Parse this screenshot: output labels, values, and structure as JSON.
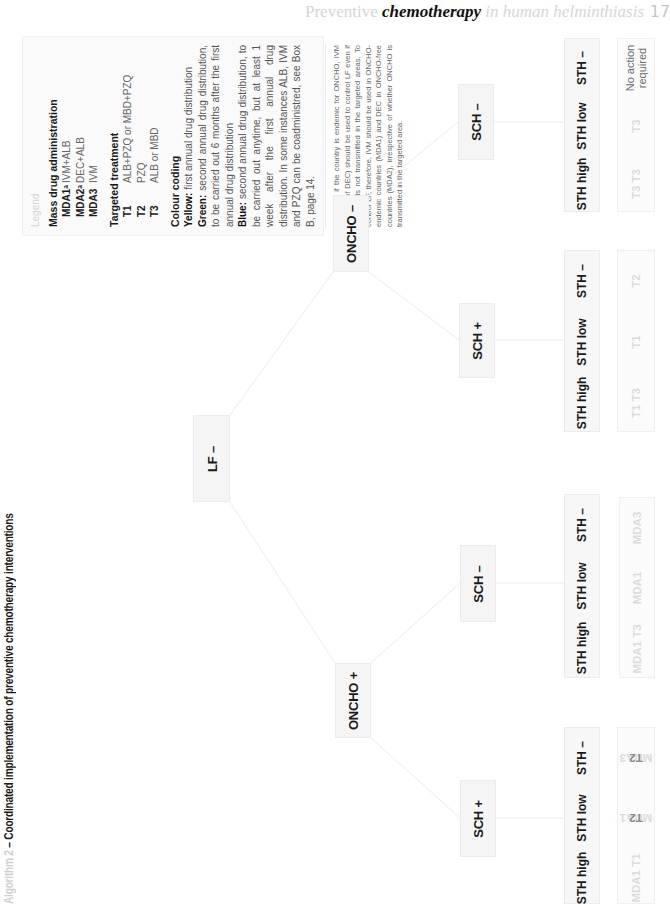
{
  "running_header": {
    "part1": "Preventive ",
    "part2": "chemotherapy",
    "part3": " in human helminthiasis",
    "page_number": "17"
  },
  "title": {
    "prefix": "Algorithm 2",
    "text": " – Coordinated implementation of preventive chemotherapy interventions"
  },
  "legend": {
    "heading": "Legend",
    "mda": {
      "title": "Mass drug administration",
      "items": [
        {
          "key": "MDA1ᵃ",
          "value": "IVM+ALB"
        },
        {
          "key": "MDA2ᵃ",
          "value": "DEC+ALB"
        },
        {
          "key": "MDA3",
          "value": "IVM"
        }
      ]
    },
    "targeted": {
      "title": "Targeted treatment",
      "items": [
        {
          "key": "T1",
          "value": "ALB+PZQ or MBD+PZQ"
        },
        {
          "key": "T2",
          "value": "PZQ"
        },
        {
          "key": "T3",
          "value": "ALB or MBD"
        }
      ]
    },
    "colour": {
      "title": "Colour coding",
      "yellow_label": "Yellow:",
      "yellow_text": " first annual drug distribution",
      "green_label": "Green:",
      "green_text": " second annual drug distribution, to be carried out 6 months after the first annual drug distribution",
      "blue_label": "Blue:",
      "blue_text": " second annual drug distribution, to be carried out anytime, but at least 1 week after the first annual drug distribution. In some instances ALB, IVM and PZQ can be coadministred, see Box B, page 14."
    },
    "footnote": "ᵃMDA1/2: if the country is endemic for ONCHO, IVM (instead of DEC) should be used to control LF even if ONCHO is not transmitted in the targeted areas. To control LF, therefore, IVM should be used in ONCHO-endemic countries (MDA1) and DEC in ONCHO-free countries (MDA2), irrespective of whether ONCHO is transmitted in the targeted area."
  },
  "tree": {
    "root": "LF –",
    "oncho_minus": "ONCHO –",
    "oncho_plus": "ONCHO +",
    "branches": [
      {
        "parent": "ONCHO –",
        "sch": "SCH –",
        "sth": [
          "STH high",
          "STH low",
          "STH –"
        ],
        "treatments": [
          {
            "faded": "T3 T3",
            "dark": ""
          },
          {
            "faded": "T3",
            "dark": ""
          },
          {
            "faded": "",
            "dark": "",
            "note": "No action required"
          }
        ]
      },
      {
        "parent": "ONCHO –",
        "sch": "SCH +",
        "sth": [
          "STH high",
          "STH low",
          "STH –"
        ],
        "treatments": [
          {
            "faded": "T1 T3",
            "dark": ""
          },
          {
            "faded": "T1",
            "dark": ""
          },
          {
            "faded": "T2",
            "dark": ""
          }
        ]
      },
      {
        "parent": "ONCHO +",
        "sch": "SCH –",
        "sth": [
          "STH high",
          "STH low",
          "STH –"
        ],
        "treatments": [
          {
            "faded": "MDA1 T3",
            "dark": ""
          },
          {
            "faded": "MDA1",
            "dark": ""
          },
          {
            "faded": "MDA3",
            "dark": ""
          }
        ]
      },
      {
        "parent": "ONCHO +",
        "sch": "SCH +",
        "sth": [
          "STH high",
          "STH low",
          "STH –"
        ],
        "treatments": [
          {
            "faded": "MDA1 T1",
            "dark": ""
          },
          {
            "faded": "MDA1 ",
            "dark": "T2"
          },
          {
            "faded": "MDA3 ",
            "dark": "T2"
          }
        ]
      }
    ]
  },
  "colors": {
    "node_bg": "#f5f5f5",
    "node_border": "#ececec",
    "edge": "#ececec",
    "text_dark": "#1a1a1a",
    "faded_text": "#dcdcdc"
  }
}
